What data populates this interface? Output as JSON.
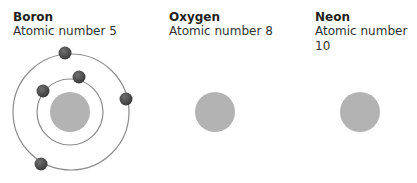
{
  "atoms": [
    {
      "name": "Boron",
      "subtitle": "Atomic number 5",
      "label_x": 13,
      "nucleus": {
        "cx": 70,
        "cy": 112,
        "r": 20
      },
      "orbits": [
        {
          "cx": 70,
          "cy": 112,
          "r": 33
        },
        {
          "cx": 71,
          "cy": 112,
          "r": 58
        }
      ],
      "electrons": [
        {
          "cx": 65,
          "cy": 53
        },
        {
          "cx": 79,
          "cy": 77
        },
        {
          "cx": 43,
          "cy": 91
        },
        {
          "cx": 126,
          "cy": 99
        },
        {
          "cx": 41,
          "cy": 164
        }
      ]
    },
    {
      "name": "Oxygen",
      "subtitle": "Atomic number 8",
      "label_x": 169,
      "nucleus": {
        "cx": 215,
        "cy": 112,
        "r": 20
      },
      "orbits": [],
      "electrons": []
    },
    {
      "name": "Neon",
      "subtitle": "Atomic number 10",
      "label_x": 315,
      "nucleus": {
        "cx": 360,
        "cy": 112,
        "r": 20
      },
      "orbits": [],
      "electrons": []
    }
  ],
  "colors": {
    "nucleus": "#b3b3b3",
    "orbit": "#8c8c8c",
    "electron": "#4a4a4a",
    "electron_highlight": "#6e6e6e"
  }
}
